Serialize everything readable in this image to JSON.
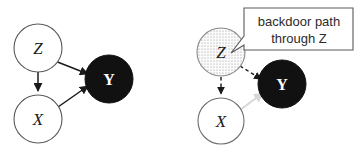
{
  "diagram": {
    "type": "causal-dag-pair",
    "title": "",
    "panels": [
      {
        "id": "left-panel",
        "name": "plain-dag",
        "nodes": [
          {
            "id": "Z",
            "label": "Z",
            "style": "open",
            "fill": "#ffffff",
            "stroke": "#5a5a5a",
            "cx": 38,
            "cy": 48,
            "r": 24
          },
          {
            "id": "X",
            "label": "X",
            "style": "open",
            "fill": "#ffffff",
            "stroke": "#5a5a5a",
            "cx": 38,
            "cy": 119,
            "r": 24
          },
          {
            "id": "Y",
            "label": "Y",
            "style": "filled",
            "fill": "#111111",
            "stroke": "#111111",
            "cx": 109,
            "cy": 79,
            "r": 24
          }
        ],
        "edges": [
          {
            "from": "Z",
            "to": "X",
            "style": "solid",
            "color": "#1a1a1a"
          },
          {
            "from": "Z",
            "to": "Y",
            "style": "solid",
            "color": "#1a1a1a"
          },
          {
            "from": "X",
            "to": "Y",
            "style": "solid",
            "color": "#1a1a1a"
          }
        ]
      },
      {
        "id": "right-panel",
        "name": "backdoor-highlighted-dag",
        "nodes": [
          {
            "id": "Z",
            "label": "Z",
            "style": "stippled",
            "fill": "#f2f2f2",
            "stroke": "#8a8a8a",
            "cx": 221,
            "cy": 52,
            "r": 24
          },
          {
            "id": "X",
            "label": "X",
            "style": "open",
            "fill": "#ffffff",
            "stroke": "#6e6e6e",
            "cx": 221,
            "cy": 121,
            "r": 23
          },
          {
            "id": "Y",
            "label": "Y",
            "style": "filled",
            "fill": "#111111",
            "stroke": "#111111",
            "cx": 282,
            "cy": 84,
            "r": 24
          }
        ],
        "edges": [
          {
            "from": "Z",
            "to": "X",
            "style": "dashed",
            "color": "#1a1a1a"
          },
          {
            "from": "Z",
            "to": "Y",
            "style": "dashed",
            "color": "#1a1a1a"
          },
          {
            "from": "X",
            "to": "Y",
            "style": "solid-faded",
            "color": "#d6d6d6"
          }
        ],
        "callout": {
          "line1": "backdoor path",
          "line2": "through Z",
          "stroke": "#5a5a5a",
          "fill": "#ffffff",
          "points_to": "Z"
        }
      }
    ],
    "colors": {
      "background": "#ffffff",
      "node_outline": "#5a5a5a",
      "node_filled": "#111111",
      "edge_solid": "#1a1a1a",
      "edge_faded": "#d6d6d6",
      "callout_border": "#5a5a5a",
      "text": "#2b2b2b"
    }
  }
}
